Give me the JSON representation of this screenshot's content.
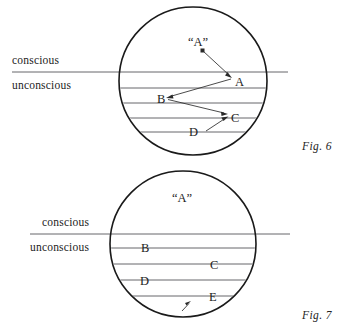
{
  "plate": {
    "title": "Two-circle psyche stratification diagrams",
    "background_color": "#ffffff",
    "ink_color": "#1a1a1a",
    "stratum_line_color": "#55565a"
  },
  "figures": [
    {
      "id": "fig6",
      "caption": "Fig. 6",
      "caption_pos": {
        "x": 302,
        "y": 141
      },
      "circle": {
        "cx": 193,
        "cy": 81,
        "r": 74
      },
      "boundary_line": {
        "label_above": "conscious",
        "label_below": "unconscious",
        "y": 72,
        "x1": 12,
        "x2": 288,
        "label_above_pos": {
          "x": 12,
          "y": 55
        },
        "label_below_pos": {
          "x": 12,
          "y": 80
        }
      },
      "strata_y": [
        88,
        103,
        118,
        132
      ],
      "markers": [
        {
          "text": "“A”",
          "x": 188,
          "y": 36,
          "kind": "quoted"
        },
        {
          "text": "A",
          "x": 235,
          "y": 76,
          "kind": "plain"
        },
        {
          "text": "B",
          "x": 157,
          "y": 93,
          "kind": "plain"
        },
        {
          "text": "C",
          "x": 231,
          "y": 112,
          "kind": "plain"
        },
        {
          "text": "D",
          "x": 189,
          "y": 126,
          "kind": "plain"
        }
      ],
      "arrows": [
        {
          "from": {
            "x": 203,
            "y": 51
          },
          "to": {
            "x": 231,
            "y": 77
          },
          "name": "arrow-quoted-a-to-a"
        },
        {
          "from": {
            "x": 231,
            "y": 79
          },
          "to": {
            "x": 167,
            "y": 97
          },
          "name": "arrow-a-to-b"
        },
        {
          "from": {
            "x": 167,
            "y": 99
          },
          "to": {
            "x": 227,
            "y": 114
          },
          "name": "arrow-b-to-c"
        },
        {
          "from": {
            "x": 206,
            "y": 131
          },
          "to": {
            "x": 227,
            "y": 117
          },
          "name": "arrow-d-to-c"
        }
      ]
    },
    {
      "id": "fig7",
      "caption": "Fig. 7",
      "caption_pos": {
        "x": 302,
        "y": 310
      },
      "circle": {
        "cx": 183,
        "cy": 244,
        "r": 73
      },
      "boundary_line": {
        "label_above": "conscious",
        "label_below": "unconscious",
        "y": 234,
        "x1": 30,
        "x2": 290,
        "label_above_pos": {
          "x": 42,
          "y": 217
        },
        "label_below_pos": {
          "x": 30,
          "y": 242
        }
      },
      "strata_y": [
        248,
        264,
        280,
        296
      ],
      "markers": [
        {
          "text": "“A”",
          "x": 172,
          "y": 192,
          "kind": "quoted"
        },
        {
          "text": "B",
          "x": 141,
          "y": 242,
          "kind": "plain"
        },
        {
          "text": "C",
          "x": 210,
          "y": 259,
          "kind": "plain"
        },
        {
          "text": "D",
          "x": 140,
          "y": 275,
          "kind": "plain"
        },
        {
          "text": "E",
          "x": 209,
          "y": 291,
          "kind": "plain"
        }
      ],
      "arrows": [
        {
          "from": {
            "x": 183,
            "y": 311
          },
          "to": {
            "x": 190,
            "y": 302
          },
          "name": "arrow-upward-from-base"
        }
      ]
    }
  ]
}
